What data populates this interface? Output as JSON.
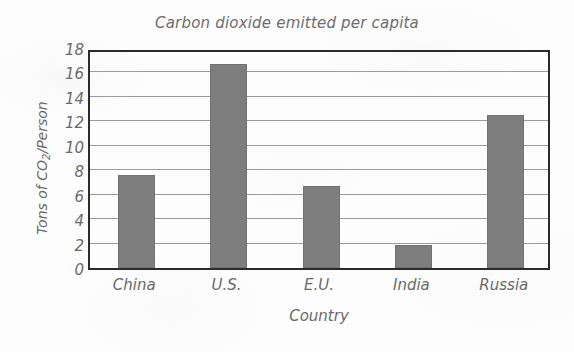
{
  "chart_data": {
    "type": "bar",
    "title": "Carbon dioxide emitted per capita",
    "xlabel": "Country",
    "ylabel": "Tons of CO2/Person",
    "ylabel_parts": {
      "prefix": "Tons of CO",
      "sub": "2",
      "suffix": "/Person"
    },
    "categories": [
      "China",
      "U.S.",
      "E.U.",
      "India",
      "Russia"
    ],
    "values": [
      7.6,
      16.7,
      6.7,
      1.9,
      12.5
    ],
    "ylim": [
      0,
      18
    ],
    "yticks": [
      0,
      2,
      4,
      6,
      8,
      10,
      12,
      14,
      16,
      18
    ],
    "ytick_labels": [
      "0",
      "2",
      "4",
      "6",
      "8",
      "10",
      "12",
      "14",
      "16",
      "18"
    ],
    "grid": true,
    "grid_axis": "y",
    "legend": false,
    "bar_color": "#7e7e7e",
    "frame_color": "#2b2b2b",
    "grid_color": "#9b9b9b",
    "text_color": "#6a6a6a",
    "background_color": "#fdfdfd",
    "style": "hand-drawn"
  }
}
